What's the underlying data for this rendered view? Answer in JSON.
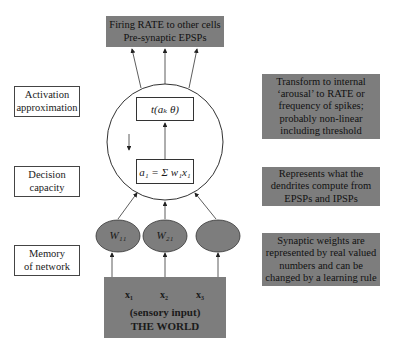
{
  "top_box": {
    "line1": "Firing RATE to other cells",
    "line2": "Pre-synaptic EPSPs"
  },
  "left_labels": [
    {
      "line1": "Activation",
      "line2": "approximation"
    },
    {
      "line1": "Decision",
      "line2": "capacity"
    },
    {
      "line1": "Memory",
      "line2": "of network"
    }
  ],
  "neuron": {
    "activation_formula": "t(aₖ θ)",
    "sum_formula": "a₁ = Σ w₁x₁"
  },
  "weights": [
    "W₁₁",
    "W₂₁",
    ""
  ],
  "inputs": {
    "x_labels": [
      "x₁",
      "x₂",
      "x₃"
    ],
    "line1": "(sensory input)",
    "line2": "THE WORLD"
  },
  "right_notes": [
    {
      "lines": [
        "Transform to internal",
        "‘arousal’ to RATE or",
        "frequency of spikes;",
        "probably non-linear",
        "including threshold"
      ]
    },
    {
      "lines": [
        "Represents what the",
        "dendrites compute from",
        "EPSPs and IPSPs"
      ]
    },
    {
      "lines": [
        "Synaptic weights are",
        "represented by real valued",
        "numbers and can be",
        "changed by a learning rule"
      ]
    }
  ],
  "colors": {
    "box_fill": "#7d7d7d",
    "line": "#333333"
  }
}
